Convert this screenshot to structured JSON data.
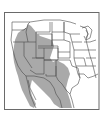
{
  "map": {
    "type": "species-range-map",
    "region": "Western North America",
    "colors": {
      "background": "#ffffff",
      "range_fill": "#a9a9a9",
      "border": "#4a4a4a",
      "frame": "#6a6a6a"
    },
    "legend": []
  }
}
